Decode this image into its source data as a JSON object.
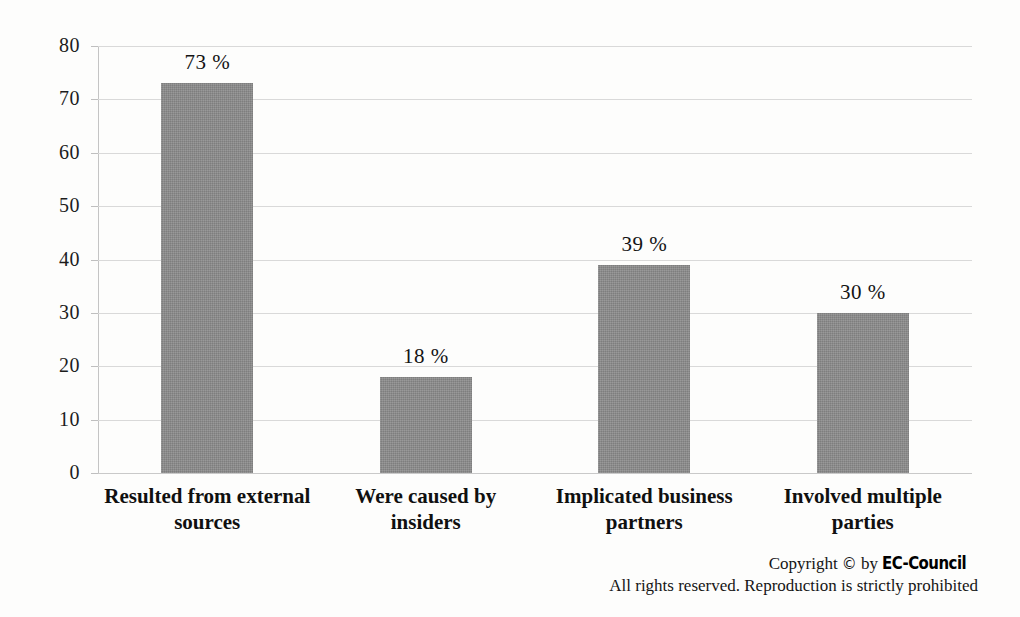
{
  "chart_data": {
    "type": "bar",
    "title": "",
    "xlabel": "",
    "ylabel": "",
    "ylim": [
      0,
      80
    ],
    "yticks": [
      0,
      10,
      20,
      30,
      40,
      50,
      60,
      70,
      80
    ],
    "grid": true,
    "legend": "none",
    "orientation": "vertical",
    "bar_color": "#8d8d8d",
    "categories": [
      "Resulted from external sources",
      "Were caused by insiders",
      "Implicated business partners",
      "Involved multiple parties"
    ],
    "category_lines": [
      [
        "Resulted from external",
        "sources"
      ],
      [
        "Were caused by",
        "insiders"
      ],
      [
        "Implicated business",
        "partners"
      ],
      [
        "Involved multiple",
        "parties"
      ]
    ],
    "values": [
      73,
      18,
      39,
      30
    ],
    "data_labels": [
      "73 %",
      "18 %",
      "39 %",
      "30 %"
    ],
    "tick_labels": [
      "80",
      "70",
      "60",
      "50",
      "40",
      "30",
      "20",
      "10",
      "0"
    ]
  },
  "footer": {
    "copyright_prefix": "Copyright",
    "copyright_symbol": "©",
    "copyright_by": "by",
    "brand": "EC-Council",
    "rights": "All rights reserved. Reproduction is strictly prohibited"
  },
  "colors": {
    "bar": "#8d8d8d",
    "gridline": "#d9d9d9",
    "axis": "#c4c4c4",
    "text": "#141414",
    "background": "#fdfdfc"
  }
}
